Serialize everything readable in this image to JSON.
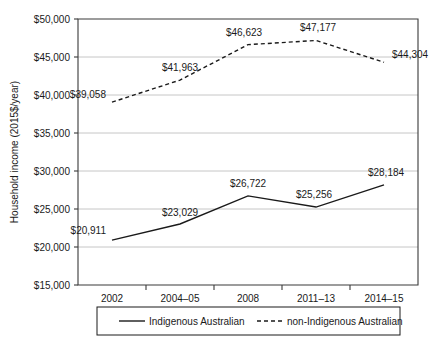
{
  "chart_data": {
    "type": "line",
    "title": "",
    "xlabel": "",
    "ylabel": "Household income (2015$/year)",
    "categories": [
      "2002",
      "2004–05",
      "2008",
      "2011–13",
      "2014–15"
    ],
    "series": [
      {
        "name": "Indigenous Australian",
        "style": "solid",
        "values": [
          20911,
          23029,
          26722,
          25256,
          28184
        ],
        "labels": [
          "$20,911",
          "$23,029",
          "$26,722",
          "$25,256",
          "$28,184"
        ]
      },
      {
        "name": "non-Indigenous Australian",
        "style": "dashed",
        "values": [
          39058,
          41963,
          46623,
          47177,
          44304
        ],
        "labels": [
          "$39,058",
          "$41,963",
          "$46,623",
          "$47,177",
          "$44,304"
        ]
      }
    ],
    "ylim": [
      15000,
      50000
    ],
    "ytick_values": [
      15000,
      20000,
      25000,
      30000,
      35000,
      40000,
      45000,
      50000
    ],
    "ytick_labels": [
      "$15,000",
      "$20,000",
      "$25,000",
      "$30,000",
      "$35,000",
      "$40,000",
      "$45,000",
      "$50,000"
    ],
    "grid": true,
    "legend_position": "bottom",
    "colors": {
      "line": "#1a1a1a",
      "grid": "#b8b8b8",
      "axis": "#3a3a3a",
      "background": "#ffffff"
    }
  },
  "legend": {
    "items": [
      {
        "label": "Indigenous Australian",
        "style": "solid"
      },
      {
        "label": "non-Indigenous Australian",
        "style": "dashed"
      }
    ]
  }
}
